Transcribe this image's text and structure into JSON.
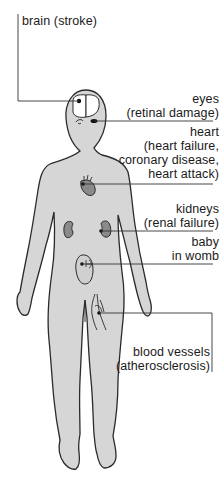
{
  "colors": {
    "body_fill": "#d6d6d6",
    "outline": "#2a2a2a",
    "organ_fill": "#8a8a8a",
    "leader_line": "#333333",
    "text": "#1a1a1a"
  },
  "labels": {
    "brain": {
      "lines": [
        "brain (stroke)"
      ]
    },
    "eyes": {
      "lines": [
        "eyes",
        "(retinal damage)"
      ]
    },
    "heart": {
      "lines": [
        "heart",
        "(heart failure,",
        "coronary disease,",
        "heart attack)"
      ]
    },
    "kidneys": {
      "lines": [
        "kidneys",
        "(renal failure)"
      ]
    },
    "baby": {
      "lines": [
        "baby",
        "in womb"
      ]
    },
    "blood_vessels": {
      "lines": [
        "blood vessels",
        "(atherosclerosis)"
      ]
    }
  },
  "organs": [
    {
      "name": "brain",
      "icon": "brain-icon"
    },
    {
      "name": "eyes",
      "icon": "eye-icon"
    },
    {
      "name": "heart",
      "icon": "heart-icon"
    },
    {
      "name": "kidneys",
      "icon": "kidney-icon"
    },
    {
      "name": "womb",
      "icon": "baby-in-womb-icon"
    },
    {
      "name": "blood vessels",
      "icon": "blood-vessel-icon"
    }
  ]
}
